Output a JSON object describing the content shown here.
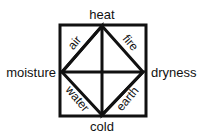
{
  "diagram": {
    "qualities": {
      "top": "heat",
      "left": "moisture",
      "right": "dryness",
      "bottom": "cold"
    },
    "elements": {
      "top_left": "air",
      "top_right": "fire",
      "bottom_left": "water",
      "bottom_right": "earth"
    },
    "stroke_color": "#111111"
  }
}
